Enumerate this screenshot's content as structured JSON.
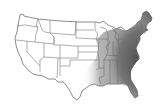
{
  "map": {
    "subject": "United States state outline map",
    "shaded_region": "Eastern United States",
    "shade_color": "#5e5e5e",
    "outline_color": "#5a5a5a",
    "background": "#ffffff"
  }
}
